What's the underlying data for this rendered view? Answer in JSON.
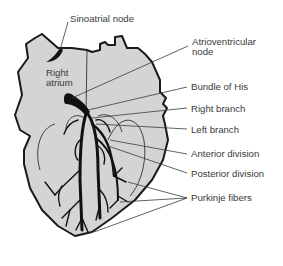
{
  "diagram": {
    "colors": {
      "heart_fill": "#d4d4d4",
      "outline": "#1a1a1a",
      "conduction": "#111111",
      "leader": "#3a3a3a",
      "text": "#3a3a3a",
      "background": "#ffffff"
    },
    "labels": {
      "sinoatrial_node": "Sinoatrial node",
      "right_atrium_line1": "Right",
      "right_atrium_line2": "atrium",
      "av_node_line1": "Atrioventricular",
      "av_node_line2": "node",
      "bundle_of_his": "Bundle of His",
      "right_branch": "Right branch",
      "left_branch": "Left branch",
      "anterior_division": "Anterior division",
      "posterior_division": "Posterior division",
      "purkinje_fibers": "Purkinje fibers"
    }
  }
}
